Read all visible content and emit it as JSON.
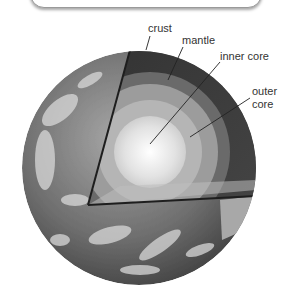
{
  "diagram": {
    "labels": [
      {
        "id": "crust",
        "text": "crust"
      },
      {
        "id": "mantle",
        "text": "mantle"
      },
      {
        "id": "inner_core",
        "text": "inner core"
      },
      {
        "id": "outer_core_line1",
        "text": "outer"
      },
      {
        "id": "outer_core_line2",
        "text": "core"
      }
    ],
    "colors": {
      "mantle": "#3a3a3a",
      "outer_core": "#9a9a9a",
      "inner_core": "#e6e6e6",
      "ocean": "#6e6e6e",
      "clouds": "#d8d8d8",
      "leader_line": "#222222"
    }
  }
}
